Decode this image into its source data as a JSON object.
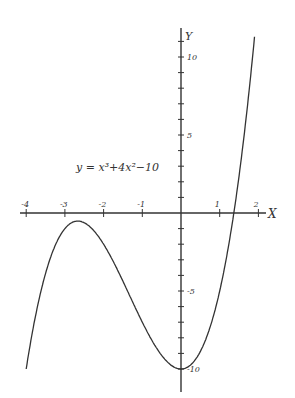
{
  "chart_data": {
    "type": "line",
    "equation_label": "y = x³+4x²−10",
    "xlabel": "X",
    "ylabel": "Y",
    "xlim": [
      -4,
      2.3
    ],
    "ylim": [
      -10.5,
      12
    ],
    "x_ticks": [
      -4,
      -3,
      -2,
      -1,
      1,
      2
    ],
    "x_tick_labels": [
      "-4",
      "-3",
      "-2",
      "-1",
      "1",
      "2"
    ],
    "y_tick_labels": [
      {
        "value": 10,
        "label": "10"
      },
      {
        "value": 5,
        "label": "5"
      },
      {
        "value": -5,
        "label": "-5"
      },
      {
        "value": -10,
        "label": "-10"
      }
    ],
    "grid": false,
    "series": [
      {
        "name": "y = x^3 + 4x^2 - 10",
        "x": [
          -4,
          -3.5,
          -3,
          -2.67,
          -2.5,
          -2,
          -1.5,
          -1,
          -0.5,
          0,
          0.5,
          1,
          1.37,
          1.5,
          2,
          2.2
        ],
        "y": [
          -10,
          -2.875,
          -1,
          -0.52,
          -0.625,
          -2,
          -4.375,
          -7,
          -9.125,
          -10,
          -8.875,
          -5,
          0,
          1.375,
          14,
          20.0
        ]
      }
    ],
    "annotations": [
      "local max ≈ (-2.67, -0.52)",
      "local min (0, -10)",
      "root ≈ 1.365"
    ]
  }
}
